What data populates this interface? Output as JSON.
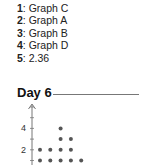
{
  "answers": [
    {
      "num": "1",
      "sep": ": ",
      "text": "Graph C"
    },
    {
      "num": "2",
      "sep": ": ",
      "text": "Graph A"
    },
    {
      "num": "3",
      "sep": ": ",
      "text": "Graph B"
    },
    {
      "num": "4",
      "sep": ": ",
      "text": "Graph D"
    },
    {
      "num": "5",
      "sep": ": ",
      "text": "2.36"
    }
  ],
  "section": {
    "title": "Day 6"
  },
  "chart_data": {
    "type": "scatter",
    "subtype": "dot_plot",
    "title": "Day 6",
    "xlabel": "",
    "ylabel": "",
    "y_tick_labels": [
      "2",
      "4"
    ],
    "columns": [
      1,
      2,
      3,
      4,
      5
    ],
    "counts": [
      2,
      2,
      4,
      3,
      1
    ],
    "grid": false,
    "legend": null,
    "colors": {
      "dot": "#555555",
      "axis": "#777777"
    }
  }
}
